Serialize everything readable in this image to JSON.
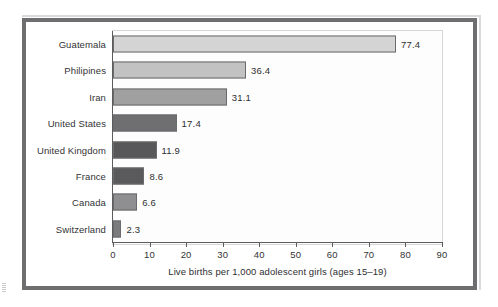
{
  "chart_data": {
    "type": "bar",
    "orientation": "horizontal",
    "title": "",
    "xlabel": "Live births per 1,000 adolescent girls (ages 15–19)",
    "ylabel": "",
    "xlim": [
      0,
      90
    ],
    "xticks": [
      0,
      10,
      20,
      30,
      40,
      50,
      60,
      70,
      80,
      90
    ],
    "grid": false,
    "legend": null,
    "categories": [
      "Guatemala",
      "Philipines",
      "Iran",
      "United States",
      "United Kingdom",
      "France",
      "Canada",
      "Switzerland"
    ],
    "values": [
      77.4,
      36.4,
      31.1,
      17.4,
      11.9,
      8.6,
      6.6,
      2.3
    ],
    "value_labels": [
      "77.4",
      "36.4",
      "31.1",
      "17.4",
      "11.9",
      "8.6",
      "6.6",
      "2.3"
    ],
    "bar_colors": [
      "#d4d4d4",
      "#c2c2c2",
      "#a0a0a0",
      "#6f6f71",
      "#58585a",
      "#5a5a5c",
      "#8f8f91",
      "#7c7c7e"
    ],
    "bar_border_color": "#6b6b6d",
    "axis_color": "#5c5c5e",
    "plot_background": "#fdfdfd",
    "frame_color": "#6e6e70"
  }
}
